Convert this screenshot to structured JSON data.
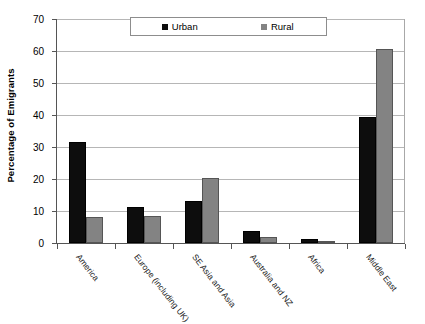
{
  "chart_data": {
    "type": "bar",
    "title": "",
    "xlabel": "",
    "ylabel": "Percentage of Emigrants",
    "ylim": [
      0,
      70
    ],
    "yticks": [
      0,
      10,
      20,
      30,
      40,
      50,
      60,
      70
    ],
    "grid": true,
    "legend_position": "top-center",
    "categories": [
      "America",
      "Europe (including UK)",
      "SE Asia and Asia",
      "Australia and NZ",
      "Africa",
      "Middle East"
    ],
    "series": [
      {
        "name": "Urban",
        "color": "#0d0d0d",
        "values": [
          31.5,
          11.3,
          13.0,
          3.8,
          1.2,
          39.5
        ]
      },
      {
        "name": "Rural",
        "color": "#838383",
        "values": [
          8.0,
          8.5,
          20.2,
          2.0,
          0.5,
          60.7
        ]
      }
    ]
  },
  "axis": {
    "y_title": "Percentage of Emigrants",
    "y_tick_labels": [
      "70",
      "60",
      "50",
      "40",
      "30",
      "20",
      "10",
      "0"
    ]
  },
  "legend": {
    "items": [
      {
        "label": "Urban",
        "color": "#0d0d0d"
      },
      {
        "label": "Rural",
        "color": "#838383"
      }
    ]
  }
}
